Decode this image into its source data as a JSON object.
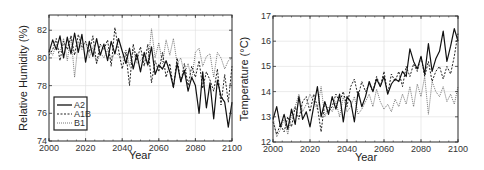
{
  "chart_data": [
    {
      "type": "line",
      "title": "",
      "xlabel": "Year",
      "ylabel": "Relative Humidity (%)",
      "xlim": [
        2000,
        2100
      ],
      "ylim": [
        74,
        83.1
      ],
      "xticks": [
        2000,
        2020,
        2040,
        2060,
        2080,
        2100
      ],
      "yticks": [
        74,
        76,
        78,
        80,
        82
      ],
      "grid": true,
      "legend_position": "lower-left",
      "x": [
        2000,
        2002,
        2004,
        2006,
        2008,
        2010,
        2012,
        2014,
        2016,
        2018,
        2020,
        2022,
        2024,
        2026,
        2028,
        2030,
        2032,
        2034,
        2036,
        2038,
        2040,
        2042,
        2044,
        2046,
        2048,
        2050,
        2052,
        2054,
        2056,
        2058,
        2060,
        2062,
        2064,
        2066,
        2068,
        2070,
        2072,
        2074,
        2076,
        2078,
        2080,
        2082,
        2084,
        2086,
        2088,
        2090,
        2092,
        2094,
        2096,
        2098,
        2100
      ],
      "series": [
        {
          "name": "A2",
          "style": "solid",
          "values": [
            80.4,
            81.3,
            80.6,
            81.6,
            80.0,
            81.5,
            80.3,
            81.8,
            80.4,
            81.7,
            79.7,
            81.2,
            80.1,
            81.4,
            80.2,
            81.0,
            79.8,
            81.2,
            80.3,
            81.4,
            80.5,
            79.6,
            80.7,
            79.2,
            80.3,
            79.0,
            80.4,
            79.5,
            80.8,
            78.8,
            79.5,
            79.2,
            79.8,
            79.0,
            77.9,
            79.6,
            78.3,
            79.1,
            77.6,
            78.6,
            78.0,
            76.0,
            79.0,
            76.4,
            78.2,
            75.6,
            78.4,
            77.2,
            76.8,
            75.0,
            76.8
          ]
        },
        {
          "name": "A1B",
          "style": "dashed",
          "values": [
            80.2,
            80.6,
            81.4,
            79.8,
            81.2,
            80.6,
            81.6,
            80.2,
            81.7,
            80.8,
            81.2,
            80.4,
            81.6,
            79.6,
            81.0,
            80.6,
            81.3,
            79.4,
            82.2,
            80.6,
            79.2,
            80.4,
            78.0,
            81.0,
            79.8,
            80.8,
            79.4,
            81.0,
            78.2,
            79.8,
            79.0,
            80.4,
            78.6,
            79.6,
            77.8,
            80.0,
            78.2,
            79.6,
            78.0,
            79.4,
            78.6,
            79.8,
            77.8,
            79.0,
            78.4,
            77.6,
            79.2,
            76.6,
            78.8,
            76.8,
            79.4
          ]
        },
        {
          "name": "B1",
          "style": "dotted",
          "values": [
            80.6,
            80.2,
            81.0,
            80.4,
            81.4,
            79.8,
            81.6,
            78.6,
            81.2,
            80.6,
            81.2,
            80.0,
            80.8,
            79.6,
            80.4,
            80.0,
            80.6,
            79.8,
            80.4,
            80.2,
            80.0,
            80.6,
            79.4,
            80.6,
            79.6,
            79.8,
            80.2,
            79.4,
            82.1,
            80.0,
            81.1,
            79.6,
            81.3,
            80.2,
            81.4,
            79.6,
            80.0,
            78.8,
            79.6,
            78.4,
            80.4,
            80.7,
            79.4,
            80.1,
            80.3,
            78.6,
            80.4,
            80.0,
            79.2,
            79.8,
            80.0
          ]
        }
      ]
    },
    {
      "type": "line",
      "title": "",
      "xlabel": "Year",
      "ylabel": "Temperature (°C)",
      "xlim": [
        2000,
        2100
      ],
      "ylim": [
        12,
        17
      ],
      "xticks": [
        2000,
        2020,
        2040,
        2060,
        2080,
        2100
      ],
      "yticks": [
        12,
        13,
        14,
        15,
        16,
        17
      ],
      "grid": true,
      "legend_position": "none",
      "x": [
        2000,
        2002,
        2004,
        2006,
        2008,
        2010,
        2012,
        2014,
        2016,
        2018,
        2020,
        2022,
        2024,
        2026,
        2028,
        2030,
        2032,
        2034,
        2036,
        2038,
        2040,
        2042,
        2044,
        2046,
        2048,
        2050,
        2052,
        2054,
        2056,
        2058,
        2060,
        2062,
        2064,
        2066,
        2068,
        2070,
        2072,
        2074,
        2076,
        2078,
        2080,
        2082,
        2084,
        2086,
        2088,
        2090,
        2092,
        2094,
        2096,
        2098,
        2100
      ],
      "series": [
        {
          "name": "A2",
          "style": "solid",
          "values": [
            12.9,
            13.4,
            12.6,
            13.1,
            12.5,
            13.3,
            12.7,
            13.8,
            12.9,
            13.2,
            12.6,
            13.4,
            14.2,
            13.0,
            13.6,
            13.1,
            13.8,
            13.3,
            13.9,
            12.8,
            13.8,
            13.6,
            12.8,
            14.0,
            13.4,
            13.8,
            14.4,
            14.0,
            14.5,
            14.2,
            14.6,
            13.9,
            14.3,
            14.5,
            14.4,
            14.8,
            14.6,
            15.7,
            15.2,
            14.9,
            15.4,
            14.7,
            15.9,
            14.8,
            15.3,
            15.6,
            16.4,
            15.2,
            15.8,
            16.5,
            16.0
          ]
        },
        {
          "name": "A1B",
          "style": "dashed",
          "values": [
            12.8,
            12.3,
            12.7,
            12.4,
            13.0,
            12.6,
            13.4,
            12.9,
            13.6,
            13.8,
            13.2,
            13.9,
            13.4,
            12.4,
            13.6,
            13.2,
            13.4,
            13.9,
            13.6,
            14.0,
            13.4,
            14.2,
            14.5,
            13.8,
            14.4,
            14.0,
            14.3,
            14.0,
            14.6,
            14.2,
            14.8,
            13.9,
            14.7,
            14.4,
            14.8,
            14.2,
            15.0,
            14.6,
            15.1,
            14.8,
            15.4,
            14.6,
            15.2,
            14.4,
            14.8,
            15.0,
            14.5,
            15.0,
            14.7,
            15.4,
            16.3
          ]
        },
        {
          "name": "B1",
          "style": "dotted",
          "values": [
            13.0,
            12.2,
            12.5,
            12.9,
            12.3,
            13.1,
            13.4,
            13.9,
            13.2,
            13.5,
            13.9,
            13.6,
            13.3,
            14.2,
            13.0,
            13.4,
            13.2,
            13.6,
            13.0,
            13.8,
            13.2,
            13.4,
            13.8,
            13.1,
            13.3,
            13.6,
            13.9,
            13.4,
            14.1,
            13.6,
            13.3,
            13.5,
            13.2,
            13.7,
            13.4,
            13.9,
            13.5,
            14.2,
            13.4,
            14.3,
            13.8,
            14.6,
            13.1,
            14.4,
            14.0,
            13.8,
            14.2,
            13.6,
            13.9,
            13.5,
            14.2
          ]
        }
      ]
    }
  ],
  "left_plot": {
    "ylabel": "Relative Humidity (%)",
    "xlabel": "Year",
    "xtick_labels": [
      "2000",
      "2020",
      "2040",
      "2060",
      "2080",
      "2100"
    ],
    "ytick_labels": [
      "74",
      "76",
      "78",
      "80",
      "82"
    ],
    "legend": [
      "A2",
      "A1B",
      "B1"
    ]
  },
  "right_plot": {
    "ylabel": "Temperature (°C)",
    "xlabel": "Year",
    "xtick_labels": [
      "2000",
      "2020",
      "2040",
      "2060",
      "2080",
      "2100"
    ],
    "ytick_labels": [
      "12",
      "13",
      "14",
      "15",
      "16",
      "17"
    ]
  }
}
